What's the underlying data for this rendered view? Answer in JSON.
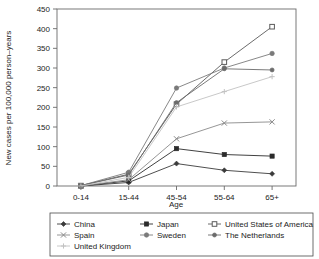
{
  "chart_data": {
    "type": "line",
    "title": "",
    "xlabel": "Age",
    "ylabel": "New cases per 100,000 person–years",
    "categories": [
      "0-14",
      "15-44",
      "45-54",
      "55-64",
      "65+"
    ],
    "ylim": [
      0,
      450
    ],
    "yticks": [
      0,
      50,
      100,
      150,
      200,
      250,
      300,
      350,
      400,
      450
    ],
    "grid": false,
    "legend_position": "bottom",
    "series": [
      {
        "name": "China",
        "marker": "diamond",
        "color": "#3b3b3b",
        "values": [
          0,
          9,
          57,
          40,
          31
        ]
      },
      {
        "name": "Japan",
        "marker": "square-filled",
        "color": "#2b2b2b",
        "values": [
          0,
          13,
          95,
          80,
          76
        ]
      },
      {
        "name": "United States of America",
        "marker": "square-open",
        "color": "#5a5a5a",
        "values": [
          1,
          30,
          208,
          315,
          405
        ]
      },
      {
        "name": "Spain",
        "marker": "x",
        "color": "#8a8a8a",
        "values": [
          0,
          16,
          120,
          160,
          163
        ]
      },
      {
        "name": "Sweden",
        "marker": "circle",
        "color": "#7a7a7a",
        "values": [
          1,
          35,
          249,
          300,
          337
        ]
      },
      {
        "name": "The Netherlands",
        "marker": "dot",
        "color": "#6b6b6b",
        "values": [
          1,
          28,
          212,
          298,
          295
        ]
      },
      {
        "name": "United Kingdom",
        "marker": "plus",
        "color": "#c2c2c2",
        "values": [
          0,
          22,
          201,
          240,
          278
        ]
      }
    ]
  },
  "axes": {
    "y_title": "New cases per 100,000 person–years",
    "x_title": "Age",
    "y_tick_labels": [
      "0",
      "50",
      "100",
      "150",
      "200",
      "250",
      "300",
      "350",
      "400",
      "450"
    ],
    "x_tick_labels": [
      "0-14",
      "15-44",
      "45-54",
      "55-64",
      "65+"
    ]
  },
  "legend": {
    "entries": [
      {
        "label": "China"
      },
      {
        "label": "Japan"
      },
      {
        "label": "United States of America"
      },
      {
        "label": "Spain"
      },
      {
        "label": "Sweden"
      },
      {
        "label": "The Netherlands"
      },
      {
        "label": "United Kingdom"
      }
    ]
  }
}
